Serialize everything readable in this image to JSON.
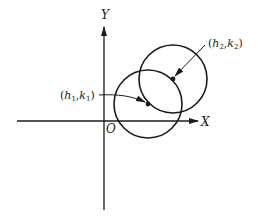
{
  "figure": {
    "axes": {
      "x_label": "X",
      "y_label": "Y",
      "origin_label": "O"
    },
    "circles": [
      {
        "name": "circle-1",
        "center_label": {
          "open": "(",
          "h": "h",
          "h_sub": "1",
          "comma": ",",
          "k": "k",
          "k_sub": "1",
          "close": ")"
        }
      },
      {
        "name": "circle-2",
        "center_label": {
          "open": "(",
          "h": "h",
          "h_sub": "2",
          "comma": ",",
          "k": "k",
          "k_sub": "2",
          "close": ")"
        }
      }
    ],
    "colors": {
      "stroke": "#1a1a1a",
      "background": "#ffffff"
    }
  }
}
